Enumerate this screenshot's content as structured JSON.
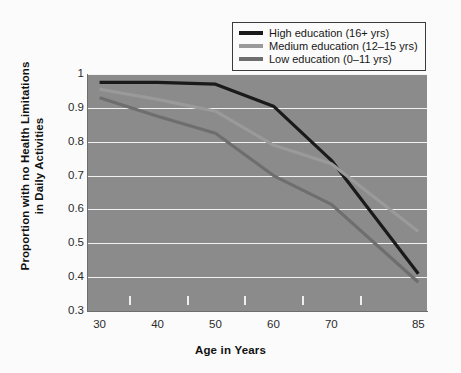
{
  "chart_data": {
    "type": "line",
    "title": "",
    "xlabel": "Age in Years",
    "ylabel": "Proportion with no Health Limitations in Daily Activities",
    "ylabel_line1": "Proportion with no Health Limitations",
    "ylabel_line2": "in Daily Activities",
    "x": [
      30,
      40,
      50,
      60,
      70,
      85
    ],
    "xlim": [
      28,
      86.5
    ],
    "ylim": [
      0.3,
      1.0
    ],
    "xticks_major": [
      30,
      40,
      50,
      60,
      70,
      85
    ],
    "xticks_major_labels": [
      "30",
      "40",
      "50",
      "60",
      "70",
      "85"
    ],
    "xticks_minor": [
      35,
      45,
      55,
      65,
      75
    ],
    "yticks": [
      0.3,
      0.4,
      0.5,
      0.6,
      0.7,
      0.8,
      0.9,
      1.0
    ],
    "ytick_labels": [
      "0.3",
      "0.4",
      "0.5",
      "0.6",
      "0.7",
      "0.8",
      "0.9",
      "1"
    ],
    "grid": "horizontal-only",
    "grid_color": "#f2f2f2",
    "plot_background": "#8b8b8b",
    "legend_position": "top-right-outside",
    "series": [
      {
        "name": "High education (16+ yrs)",
        "color": "#1a1a1a",
        "values": [
          0.975,
          0.975,
          0.97,
          0.905,
          0.745,
          0.41
        ]
      },
      {
        "name": "Medium education (12-15 yrs)",
        "color": "#9a9a9a",
        "values": [
          0.955,
          0.925,
          0.89,
          0.79,
          0.735,
          0.535
        ]
      },
      {
        "name": "Low education (0-11 yrs)",
        "color": "#6e6e6e",
        "values": [
          0.93,
          0.875,
          0.825,
          0.7,
          0.615,
          0.385
        ]
      }
    ]
  },
  "legend": {
    "items": [
      {
        "label": "High education (16+ yrs)",
        "color": "#1a1a1a"
      },
      {
        "label": "Medium education (12–15 yrs)",
        "color": "#9a9a9a"
      },
      {
        "label": "Low education (0–11 yrs)",
        "color": "#6e6e6e"
      }
    ]
  },
  "axes": {
    "x_title": "Age in Years",
    "y_title_line1": "Proportion with no Health Limitations",
    "y_title_line2": "in Daily Activities"
  }
}
